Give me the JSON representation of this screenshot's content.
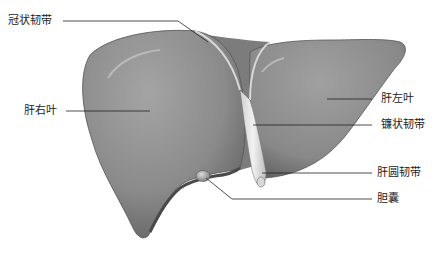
{
  "diagram": {
    "colors": {
      "background": "#ffffff",
      "liver_mid": "#8e8e8e",
      "liver_dark": "#5f5f5f",
      "liver_light": "#b5b5b5",
      "ligament": "#e6e6e6",
      "leader_line": "#222222",
      "label_text": "#222222"
    },
    "labels": {
      "coronary_ligament": "冠状韧带",
      "right_lobe": "肝右叶",
      "left_lobe": "肝左叶",
      "falciform_ligament": "镰状韧带",
      "round_ligament": "肝圆韧带",
      "gallbladder": "胆囊"
    }
  }
}
